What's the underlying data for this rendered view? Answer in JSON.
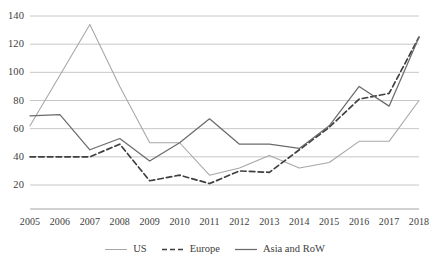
{
  "chart_data": {
    "type": "line",
    "title": "",
    "subtitle": "",
    "xlabel": "",
    "ylabel": "",
    "x": [
      2005,
      2006,
      2007,
      2008,
      2009,
      2010,
      2011,
      2012,
      2013,
      2014,
      2015,
      2016,
      2017,
      2018
    ],
    "categories": [
      "2005",
      "2006",
      "2007",
      "2008",
      "2009",
      "2010",
      "2011",
      "2012",
      "2013",
      "2014",
      "2015",
      "2016",
      "2017",
      "2018"
    ],
    "series": [
      {
        "name": "US",
        "style": "solid-light",
        "color": "#a6a6a6",
        "values": [
          62,
          98,
          134,
          90,
          50,
          50,
          27,
          32,
          41,
          32,
          36,
          51,
          51,
          80
        ]
      },
      {
        "name": "Europe",
        "style": "dashed",
        "color": "#3f3f3f",
        "values": [
          40,
          40,
          40,
          49,
          23,
          27,
          21,
          30,
          29,
          45,
          61,
          81,
          85,
          125
        ]
      },
      {
        "name": "Asia and RoW",
        "style": "solid-dark",
        "color": "#6b6b6b",
        "values": [
          69,
          70,
          45,
          53,
          37,
          50,
          67,
          49,
          49,
          46,
          62,
          90,
          76,
          125
        ]
      }
    ],
    "ylim": [
      0,
      140
    ],
    "yticks": [
      20,
      40,
      60,
      80,
      100,
      120,
      140
    ],
    "ytick_labels": [
      "20",
      "40",
      "60",
      "80",
      "100",
      "120",
      "140"
    ],
    "grid": true,
    "grid_axis": "y",
    "legend_position": "bottom",
    "legend_entries": [
      "US",
      "Europe",
      "Asia and RoW"
    ]
  },
  "axes": {
    "y_labels": [
      "140",
      "120",
      "100",
      "80",
      "60",
      "40",
      "20"
    ],
    "x_labels": [
      "2005",
      "2006",
      "2007",
      "2008",
      "2009",
      "2010",
      "2011",
      "2012",
      "2013",
      "2014",
      "2015",
      "2016",
      "2017",
      "2018"
    ]
  },
  "legend": {
    "items": [
      {
        "label": "US"
      },
      {
        "label": "Europe"
      },
      {
        "label": "Asia and RoW"
      }
    ]
  },
  "colors": {
    "us": "#a6a6a6",
    "europe": "#3f3f3f",
    "asia": "#6b6b6b",
    "grid": "#bfbfbf",
    "axis": "#9a9a9a",
    "text": "#3d3d3d"
  }
}
